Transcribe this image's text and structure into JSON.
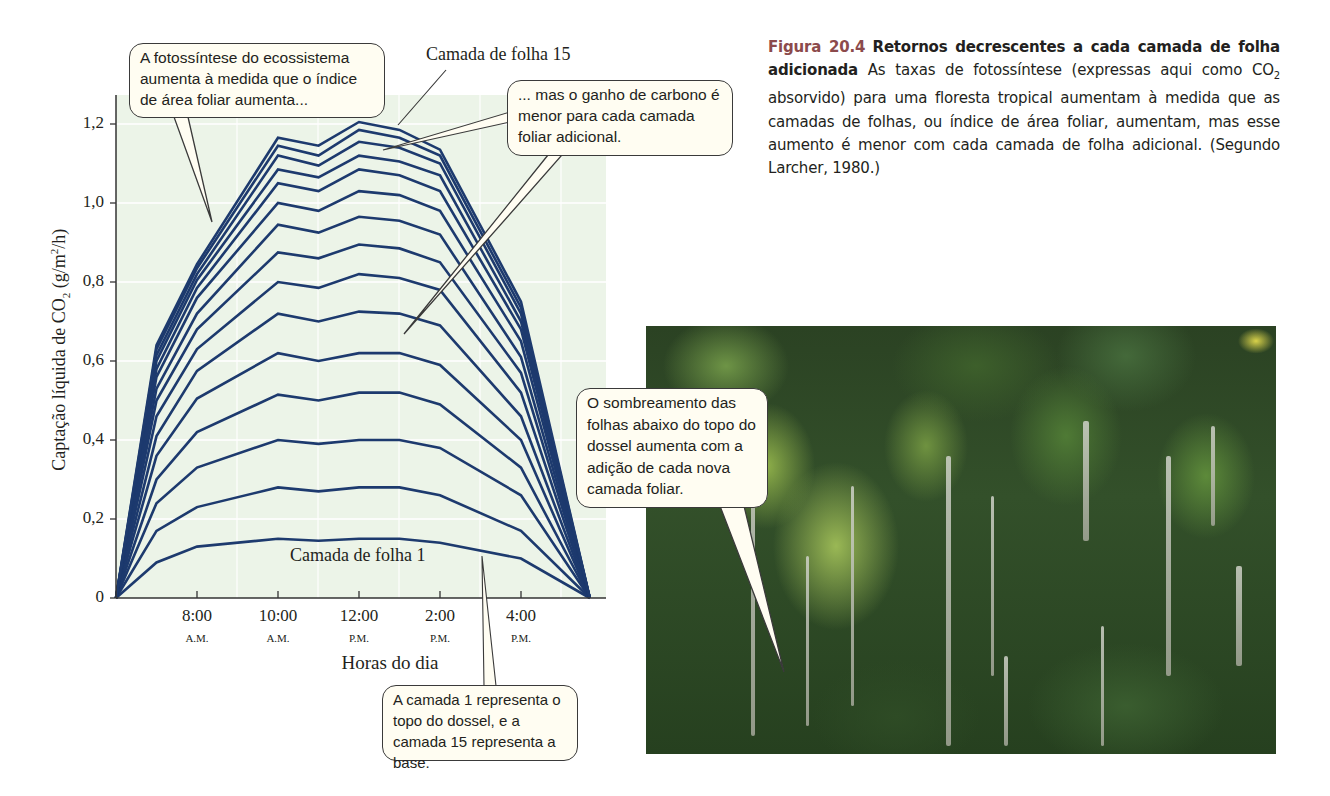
{
  "caption": {
    "figure_number": "Figura 20.4",
    "title": "Retornos decrescentes a cada camada de folha adicionada",
    "body_before_sub": "As taxas de fotossíntese (expressas aqui como CO",
    "body_sub": "2",
    "body_after_sub": " absorvido) para uma floresta tropical aumentam à medida que as camadas de folhas, ou índice de área foliar, aumentam, mas esse aumento é menor com cada camada de folha adicional. (Segundo Larcher, 1980.)"
  },
  "callouts": {
    "ecosystem_photosynthesis": "A fotossíntese do ecossistema aumenta à medida que o índice de área foliar aumenta...",
    "carbon_gain": "... mas o ganho de carbono é menor para cada camada foliar adicional.",
    "layer_meaning": "A camada 1 representa o topo do dossel, e a camada 15 representa a base.",
    "shading": "O sombreamento das folhas abaixo do topo do dossel aumenta com a adição de cada nova camada foliar."
  },
  "chart_data": {
    "type": "line",
    "title": "",
    "xlabel": "Horas do dia",
    "ylabel": "Captação líquida de CO2 (g/m2/h)",
    "ylabel_parts": {
      "pre": "Captação líquida de CO",
      "sub": "2",
      "mid": " (g/m",
      "sup": "2",
      "post": "/h)"
    },
    "ylim": [
      0,
      1.25
    ],
    "yticks": [
      0,
      0.2,
      0.4,
      0.6,
      0.8,
      1.0,
      1.2
    ],
    "ytick_labels": [
      "0",
      "0,2",
      "0,4",
      "0,6",
      "0,8",
      "1,0",
      "1,2"
    ],
    "xticks_hours": [
      8,
      10,
      12,
      14,
      16
    ],
    "xtick_labels": [
      "8:00",
      "10:00",
      "12:00",
      "2:00",
      "4:00"
    ],
    "xtick_sublabels": [
      "A.M.",
      "A.M.",
      "P.M.",
      "P.M.",
      "P.M."
    ],
    "x_range_hours": [
      6,
      17.7
    ],
    "grid": true,
    "line_color": "#1d3a6e",
    "x": [
      6,
      7,
      8,
      10,
      11,
      12,
      13,
      14,
      16,
      17.7
    ],
    "series": [
      {
        "name": "Camada de folha 1",
        "values": [
          0,
          0.09,
          0.13,
          0.15,
          0.145,
          0.15,
          0.15,
          0.14,
          0.1,
          0
        ]
      },
      {
        "name": "Camada de folha 2",
        "values": [
          0,
          0.17,
          0.23,
          0.28,
          0.27,
          0.28,
          0.28,
          0.26,
          0.17,
          0
        ]
      },
      {
        "name": "Camada de folha 3",
        "values": [
          0,
          0.24,
          0.33,
          0.4,
          0.39,
          0.4,
          0.4,
          0.38,
          0.26,
          0
        ]
      },
      {
        "name": "Camada de folha 4",
        "values": [
          0,
          0.3,
          0.42,
          0.515,
          0.5,
          0.52,
          0.52,
          0.49,
          0.33,
          0
        ]
      },
      {
        "name": "Camada de folha 5",
        "values": [
          0,
          0.36,
          0.505,
          0.62,
          0.6,
          0.62,
          0.62,
          0.59,
          0.4,
          0
        ]
      },
      {
        "name": "Camada de folha 6",
        "values": [
          0,
          0.41,
          0.575,
          0.72,
          0.7,
          0.725,
          0.72,
          0.69,
          0.46,
          0
        ]
      },
      {
        "name": "Camada de folha 7",
        "values": [
          0,
          0.46,
          0.63,
          0.8,
          0.785,
          0.82,
          0.81,
          0.78,
          0.52,
          0
        ]
      },
      {
        "name": "Camada de folha 8",
        "values": [
          0,
          0.5,
          0.68,
          0.875,
          0.86,
          0.895,
          0.885,
          0.85,
          0.57,
          0
        ]
      },
      {
        "name": "Camada de folha 9",
        "values": [
          0,
          0.53,
          0.72,
          0.945,
          0.925,
          0.965,
          0.955,
          0.92,
          0.61,
          0
        ]
      },
      {
        "name": "Camada de folha 10",
        "values": [
          0,
          0.56,
          0.76,
          1.0,
          0.98,
          1.03,
          1.02,
          0.98,
          0.65,
          0
        ]
      },
      {
        "name": "Camada de folha 11",
        "values": [
          0,
          0.58,
          0.785,
          1.05,
          1.03,
          1.085,
          1.07,
          1.03,
          0.68,
          0
        ]
      },
      {
        "name": "Camada de folha 12",
        "values": [
          0,
          0.6,
          0.805,
          1.085,
          1.065,
          1.12,
          1.105,
          1.07,
          0.7,
          0
        ]
      },
      {
        "name": "Camada de folha 13",
        "values": [
          0,
          0.615,
          0.82,
          1.12,
          1.095,
          1.155,
          1.14,
          1.1,
          0.72,
          0
        ]
      },
      {
        "name": "Camada de folha 14",
        "values": [
          0,
          0.63,
          0.835,
          1.145,
          1.12,
          1.185,
          1.165,
          1.12,
          0.735,
          0
        ]
      },
      {
        "name": "Camada de folha 15",
        "values": [
          0,
          0.64,
          0.845,
          1.165,
          1.145,
          1.205,
          1.185,
          1.135,
          0.75,
          0
        ]
      }
    ],
    "annotations": [
      "Camada de folha 15",
      "Camada de folha 1"
    ]
  },
  "photo": {
    "description": "tropical-forest-canopy-photo"
  }
}
